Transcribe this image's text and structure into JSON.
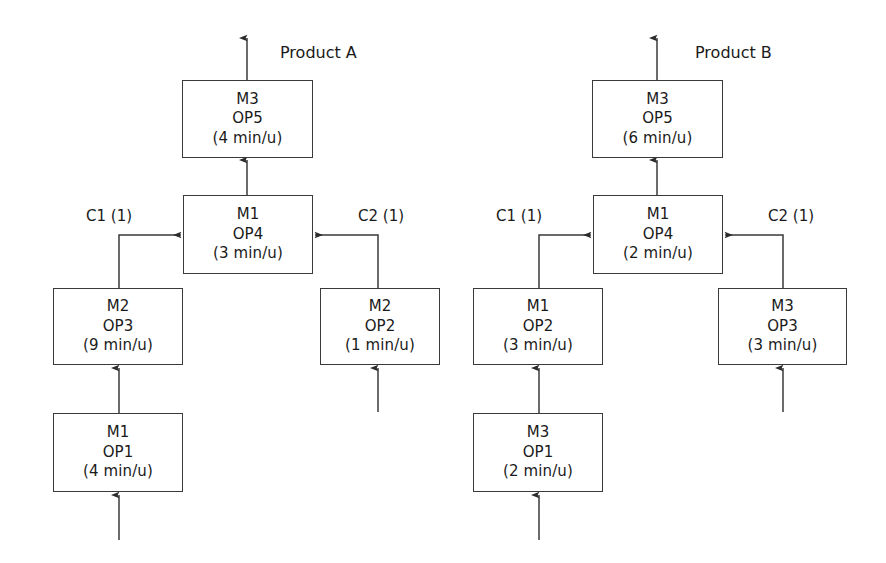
{
  "diagram": {
    "title_a": "Product A",
    "title_b": "Product B",
    "products": [
      {
        "name": "Product A",
        "label_x": 280,
        "label_y": 43,
        "output_arrow_x": 247,
        "components": [
          {
            "id": "c1",
            "text": "C1 (1)",
            "x": 86,
            "y": 207
          },
          {
            "id": "c2",
            "text": "C2 (1)",
            "x": 358,
            "y": 207
          }
        ],
        "nodes": [
          {
            "id": "a-op5",
            "machine": "M3",
            "operation": "OP5",
            "time": "(4 min/u)",
            "x": 182,
            "y": 80,
            "w": 131,
            "h": 78
          },
          {
            "id": "a-op4",
            "machine": "M1",
            "operation": "OP4",
            "time": "(3 min/u)",
            "x": 183,
            "y": 195,
            "w": 130,
            "h": 79
          },
          {
            "id": "a-op3",
            "machine": "M2",
            "operation": "OP3",
            "time": "(9 min/u)",
            "x": 53,
            "y": 288,
            "w": 130,
            "h": 77
          },
          {
            "id": "a-op2",
            "machine": "M2",
            "operation": "OP2",
            "time": "(1 min/u)",
            "x": 320,
            "y": 288,
            "w": 120,
            "h": 77
          },
          {
            "id": "a-op1",
            "machine": "M1",
            "operation": "OP1",
            "time": "(4 min/u)",
            "x": 53,
            "y": 413,
            "w": 130,
            "h": 79
          }
        ]
      },
      {
        "name": "Product B",
        "label_x": 695,
        "label_y": 43,
        "output_arrow_x": 657,
        "components": [
          {
            "id": "c1",
            "text": "C1 (1)",
            "x": 496,
            "y": 207
          },
          {
            "id": "c2",
            "text": "C2 (1)",
            "x": 768,
            "y": 207
          }
        ],
        "nodes": [
          {
            "id": "b-op5",
            "machine": "M3",
            "operation": "OP5",
            "time": "(6 min/u)",
            "x": 592,
            "y": 80,
            "w": 131,
            "h": 78
          },
          {
            "id": "b-op4",
            "machine": "M1",
            "operation": "OP4",
            "time": "(2 min/u)",
            "x": 593,
            "y": 195,
            "w": 130,
            "h": 79
          },
          {
            "id": "b-op2",
            "machine": "M1",
            "operation": "OP2",
            "time": "(3 min/u)",
            "x": 473,
            "y": 288,
            "w": 130,
            "h": 77
          },
          {
            "id": "b-op3",
            "machine": "M3",
            "operation": "OP3",
            "time": "(3 min/u)",
            "x": 718,
            "y": 288,
            "w": 129,
            "h": 77
          },
          {
            "id": "b-op1",
            "machine": "M3",
            "operation": "OP1",
            "time": "(2 min/u)",
            "x": 473,
            "y": 413,
            "w": 130,
            "h": 79
          }
        ]
      }
    ],
    "stroke_color": "#3a3a3a",
    "text_color": "#1a1a1a",
    "background_color": "#ffffff"
  }
}
